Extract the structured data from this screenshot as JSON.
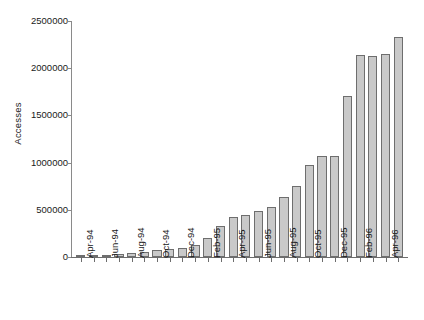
{
  "chart_data": {
    "type": "bar",
    "title": "",
    "xlabel": "",
    "ylabel": "Accesses",
    "ylim": [
      0,
      2500000
    ],
    "ytick_labels": [
      "0",
      "500000",
      "1000000",
      "1500000",
      "2000000",
      "2500000"
    ],
    "ytick_values": [
      0,
      500000,
      1000000,
      1500000,
      2000000,
      2500000
    ],
    "grid": false,
    "legend": "none",
    "bar_color": "#c9c9c9",
    "bar_edge_color": "#6e6e6e",
    "axis_color": "#6d6d6d",
    "categories": [
      "Apr-94",
      "May-94",
      "Jun-94",
      "Jul-94",
      "Aug-94",
      "Sep-94",
      "Oct-94",
      "Nov-94",
      "Dec-94",
      "Jan-95",
      "Feb-95",
      "Mar-95",
      "Apr-95",
      "May-95",
      "Jun-95",
      "Jul-95",
      "Aug-95",
      "Sep-95",
      "Oct-95",
      "Nov-95",
      "Dec-95",
      "Jan-96",
      "Feb-96",
      "Mar-96",
      "Apr-96",
      "May-96"
    ],
    "values": [
      4000,
      9000,
      22000,
      28000,
      42000,
      55000,
      72000,
      80000,
      98000,
      125000,
      205000,
      330000,
      420000,
      440000,
      490000,
      530000,
      635000,
      750000,
      980000,
      1075000,
      1075000,
      1710000,
      2140000,
      2125000,
      2155000,
      2330000
    ],
    "xtick_labels_shown": [
      "Apr-94",
      "Jun-94",
      "Aug-94",
      "Oct-94",
      "Dec-94",
      "Feb-95",
      "Apr-95",
      "Jun-95",
      "Aug-95",
      "Oct-95",
      "Dec-95",
      "Feb-96",
      "Apr-96"
    ],
    "xtick_label_indices": [
      0,
      2,
      4,
      6,
      8,
      10,
      12,
      14,
      16,
      18,
      20,
      22,
      24
    ]
  }
}
